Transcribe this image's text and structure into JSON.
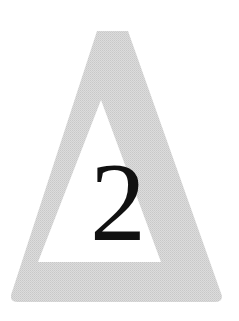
{
  "figure": {
    "numeral": "2",
    "colors": {
      "background": "#ffffff",
      "triangle_fill": "#d6d6d6",
      "triangle_inner": "#ffffff",
      "numeral": "#111111"
    }
  }
}
